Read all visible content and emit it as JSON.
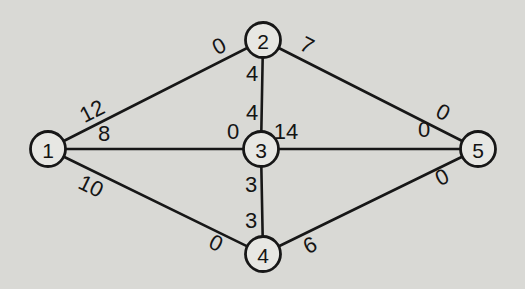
{
  "figure": {
    "background_color": "#d9d9d5",
    "line_color": "#171717",
    "node_fill": "#e7e7e3",
    "node_stroke": "#171717",
    "text_color": "#141414"
  },
  "diagram": {
    "type": "undirected-graph",
    "node_radius": 17.5,
    "nodes": [
      {
        "id": "1",
        "label": "1",
        "x": 48,
        "y": 149
      },
      {
        "id": "2",
        "label": "2",
        "x": 263,
        "y": 40
      },
      {
        "id": "3",
        "label": "3",
        "x": 261,
        "y": 149
      },
      {
        "id": "4",
        "label": "4",
        "x": 263,
        "y": 254
      },
      {
        "id": "5",
        "label": "5",
        "x": 478,
        "y": 149
      }
    ],
    "edges": [
      {
        "from": "1",
        "to": "2",
        "labels": [
          {
            "text": "12",
            "x": 92,
            "y": 111,
            "rotate": -27
          },
          {
            "text": "0",
            "x": 219,
            "y": 46,
            "rotate": -27
          }
        ]
      },
      {
        "from": "2",
        "to": "5",
        "labels": [
          {
            "text": "7",
            "x": 307,
            "y": 45,
            "rotate": 27
          },
          {
            "text": "0",
            "x": 443,
            "y": 112,
            "rotate": 27
          }
        ]
      },
      {
        "from": "1",
        "to": "3",
        "labels": [
          {
            "text": "8",
            "x": 104,
            "y": 133,
            "rotate": 0
          },
          {
            "text": "0",
            "x": 233,
            "y": 131,
            "rotate": 0
          }
        ]
      },
      {
        "from": "3",
        "to": "5",
        "labels": [
          {
            "text": "14",
            "x": 286,
            "y": 131,
            "rotate": 0
          },
          {
            "text": "0",
            "x": 424,
            "y": 129,
            "rotate": 0
          }
        ]
      },
      {
        "from": "1",
        "to": "4",
        "labels": [
          {
            "text": "10",
            "x": 91,
            "y": 186,
            "rotate": 26
          },
          {
            "text": "0",
            "x": 216,
            "y": 243,
            "rotate": 26
          }
        ]
      },
      {
        "from": "4",
        "to": "5",
        "labels": [
          {
            "text": "6",
            "x": 310,
            "y": 245,
            "rotate": -26
          },
          {
            "text": "0",
            "x": 442,
            "y": 177,
            "rotate": -26
          }
        ]
      },
      {
        "from": "2",
        "to": "3",
        "labels": [
          {
            "text": "4",
            "x": 252,
            "y": 73,
            "rotate": 0
          },
          {
            "text": "4",
            "x": 252,
            "y": 112,
            "rotate": 0
          }
        ]
      },
      {
        "from": "3",
        "to": "4",
        "labels": [
          {
            "text": "3",
            "x": 251,
            "y": 184,
            "rotate": 0
          },
          {
            "text": "3",
            "x": 251,
            "y": 220,
            "rotate": 0
          }
        ]
      }
    ]
  },
  "style": {
    "edge_stroke_width": 2.6,
    "node_stroke_width": 2.8,
    "edge_label_font_size": 22,
    "node_label_font_size": 21
  }
}
